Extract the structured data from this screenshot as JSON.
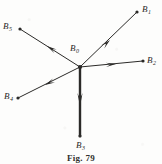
{
  "figure": {
    "caption": "Fig. 79",
    "caption_x": 81,
    "caption_y": 155,
    "width": 162,
    "height": 164,
    "background_color": "#fdfdfc",
    "ink_color": "#2b2a28",
    "origin": {
      "x": 80,
      "y": 67,
      "label_base": "B",
      "label_sub": "0",
      "label_x": 70,
      "label_y": 44
    }
  },
  "vectors": [
    {
      "id": "B1",
      "label_base": "B",
      "label_sub": "1",
      "direction": "up-right",
      "from": {
        "x": 80,
        "y": 67
      },
      "to": {
        "x": 137,
        "y": 12
      },
      "arrow_at": {
        "x": 110,
        "y": 40
      },
      "arrow_angle_deg": -44,
      "stroke_width": 1.0,
      "endpoint_dot": {
        "x": 137,
        "y": 12,
        "r": 1.6
      },
      "label_x": 142,
      "label_y": 5
    },
    {
      "id": "B2",
      "label_base": "B",
      "label_sub": "2",
      "direction": "right",
      "from": {
        "x": 80,
        "y": 67
      },
      "to": {
        "x": 143,
        "y": 61
      },
      "arrow_at": {
        "x": 116,
        "y": 64
      },
      "arrow_angle_deg": -5,
      "stroke_width": 1.0,
      "endpoint_dot": {
        "x": 143,
        "y": 61,
        "r": 1.6
      },
      "label_x": 147,
      "label_y": 56
    },
    {
      "id": "B3",
      "label_base": "B",
      "label_sub": "3",
      "direction": "down",
      "from": {
        "x": 80,
        "y": 67
      },
      "to": {
        "x": 80,
        "y": 136
      },
      "arrow_at": {
        "x": 80,
        "y": 106
      },
      "arrow_angle_deg": 90,
      "stroke_width": 2.4,
      "endpoint_dot": {
        "x": 80,
        "y": 136,
        "r": 1.6
      },
      "label_x": 76,
      "label_y": 141
    },
    {
      "id": "B4",
      "label_base": "B",
      "label_sub": "4",
      "direction": "down-left",
      "from": {
        "x": 80,
        "y": 67
      },
      "to": {
        "x": 18,
        "y": 98
      },
      "arrow_at": {
        "x": 45,
        "y": 85
      },
      "arrow_angle_deg": 153,
      "stroke_width": 1.0,
      "endpoint_dot": {
        "x": 18,
        "y": 98,
        "r": 1.6
      },
      "label_x": 4,
      "label_y": 92
    },
    {
      "id": "B5",
      "label_base": "B",
      "label_sub": "5",
      "direction": "up-left",
      "from": {
        "x": 80,
        "y": 67
      },
      "to": {
        "x": 20,
        "y": 29
      },
      "arrow_at": {
        "x": 47,
        "y": 46
      },
      "arrow_angle_deg": 212,
      "stroke_width": 1.0,
      "endpoint_dot": {
        "x": 20,
        "y": 29,
        "r": 1.6
      },
      "label_x": 3,
      "label_y": 22
    }
  ]
}
